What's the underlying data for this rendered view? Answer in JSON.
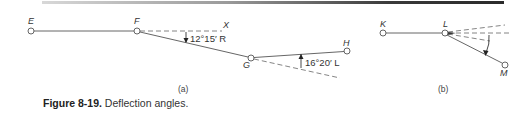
{
  "figure": {
    "caption_number": "Figure 8-19.",
    "caption_text": " Deflection angles."
  },
  "panel_a": {
    "label": "(a)",
    "points": {
      "E": "E",
      "F": "F",
      "X": "X",
      "G": "G",
      "H": "H"
    },
    "angle_1": "12°15′ R",
    "angle_2": "16°20′ L"
  },
  "panel_b": {
    "label": "(b)",
    "points": {
      "K": "K",
      "L": "L",
      "M": "M"
    }
  },
  "colors": {
    "line": "#555555",
    "dash": "#777777",
    "text": "#333333"
  }
}
